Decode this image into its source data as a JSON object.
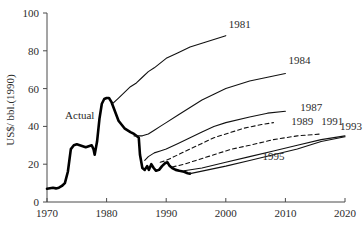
{
  "chart_data": {
    "type": "line",
    "title": "",
    "xlabel": "",
    "ylabel": "US$/ bbl.(1990)",
    "xlim": [
      1970,
      2020
    ],
    "ylim": [
      0,
      100
    ],
    "xticks": [
      "1970",
      "1980",
      "1990",
      "2000",
      "2010",
      "2020"
    ],
    "yticks": [
      "0",
      "20",
      "40",
      "60",
      "80",
      "100"
    ],
    "grid": false,
    "legend_position": "inline-end-of-line",
    "annotations": [
      {
        "text": "Actual",
        "x": 1975.5,
        "y": 44
      }
    ],
    "series": [
      {
        "name": "Actual",
        "style": "thick-solid",
        "label": "Actual",
        "points": [
          [
            1970,
            7
          ],
          [
            1971,
            7.5
          ],
          [
            1971.5,
            7.2
          ],
          [
            1972,
            7.6
          ],
          [
            1972.5,
            8.5
          ],
          [
            1973,
            10
          ],
          [
            1973.5,
            16
          ],
          [
            1974,
            28
          ],
          [
            1974.5,
            30
          ],
          [
            1975,
            30.5
          ],
          [
            1975.5,
            30
          ],
          [
            1976,
            29.5
          ],
          [
            1976.5,
            29
          ],
          [
            1977,
            29.5
          ],
          [
            1977.5,
            30
          ],
          [
            1977.8,
            28
          ],
          [
            1978,
            25
          ],
          [
            1978.4,
            32
          ],
          [
            1978.8,
            44
          ],
          [
            1979.2,
            52
          ],
          [
            1979.6,
            54.5
          ],
          [
            1980,
            55
          ],
          [
            1980.4,
            55
          ],
          [
            1980.8,
            53
          ],
          [
            1981.4,
            48
          ],
          [
            1982,
            43
          ],
          [
            1983,
            39
          ],
          [
            1984,
            37
          ],
          [
            1984.6,
            36
          ],
          [
            1985,
            35
          ],
          [
            1985.4,
            34
          ],
          [
            1985.6,
            25
          ],
          [
            1986,
            18
          ],
          [
            1986.4,
            17
          ],
          [
            1986.8,
            19
          ],
          [
            1987.1,
            17
          ],
          [
            1987.5,
            20
          ],
          [
            1987.9,
            18
          ],
          [
            1988.3,
            16.5
          ],
          [
            1988.8,
            17
          ],
          [
            1989.3,
            19
          ],
          [
            1989.8,
            20.5
          ],
          [
            1990.2,
            21
          ],
          [
            1990.6,
            19
          ],
          [
            1991,
            18
          ],
          [
            1991.6,
            17
          ],
          [
            1992.2,
            16.5
          ],
          [
            1993,
            16
          ],
          [
            1993.6,
            15.2
          ],
          [
            1994,
            15
          ]
        ]
      },
      {
        "name": "1981",
        "label": "1981",
        "style": "solid",
        "label_x": 2000.5,
        "label_y": 92,
        "points": [
          [
            1981,
            52
          ],
          [
            1982,
            55
          ],
          [
            1983,
            58
          ],
          [
            1984,
            61
          ],
          [
            1985,
            63
          ],
          [
            1986,
            66
          ],
          [
            1987,
            69
          ],
          [
            1988,
            71
          ],
          [
            1990,
            76
          ],
          [
            1992,
            79
          ],
          [
            1994,
            82
          ],
          [
            1996,
            84
          ],
          [
            1998,
            86
          ],
          [
            2000,
            88
          ]
        ]
      },
      {
        "name": "1984",
        "label": "1984",
        "style": "solid",
        "label_x": 2010.5,
        "label_y": 73,
        "points": [
          [
            1984.6,
            35
          ],
          [
            1986,
            35
          ],
          [
            1987,
            36
          ],
          [
            1988,
            38
          ],
          [
            1989,
            40
          ],
          [
            1990,
            42
          ],
          [
            1992,
            46
          ],
          [
            1994,
            50
          ],
          [
            1996,
            54
          ],
          [
            1998,
            57
          ],
          [
            2000,
            60
          ],
          [
            2004,
            64
          ],
          [
            2007,
            66
          ],
          [
            2010,
            68
          ]
        ]
      },
      {
        "name": "1987",
        "label": "1987",
        "style": "solid",
        "label_x": 2012.5,
        "label_y": 48,
        "points": [
          [
            1986.4,
            22
          ],
          [
            1987,
            24
          ],
          [
            1988,
            26
          ],
          [
            1989,
            27
          ],
          [
            1990,
            28
          ],
          [
            1992,
            31
          ],
          [
            1994,
            34
          ],
          [
            1996,
            37
          ],
          [
            1998,
            40
          ],
          [
            2000,
            42
          ],
          [
            2004,
            45
          ],
          [
            2007,
            47
          ],
          [
            2010,
            48
          ]
        ]
      },
      {
        "name": "1989",
        "label": "1989",
        "style": "dashed",
        "label_x": 2011.0,
        "label_y": 41,
        "points": [
          [
            1989,
            21
          ],
          [
            1990,
            22
          ],
          [
            1992,
            25
          ],
          [
            1994,
            28
          ],
          [
            1996,
            31
          ],
          [
            1998,
            34
          ],
          [
            2000,
            36
          ],
          [
            2003,
            39
          ],
          [
            2006,
            41
          ],
          [
            2008,
            42
          ]
        ]
      },
      {
        "name": "1991",
        "label": "1991",
        "style": "dashed",
        "label_x": 2016.0,
        "label_y": 41,
        "points": [
          [
            1991,
            18.5
          ],
          [
            1993,
            20
          ],
          [
            1995,
            22
          ],
          [
            1998,
            25
          ],
          [
            2001,
            28
          ],
          [
            2004,
            30
          ],
          [
            2008,
            33
          ],
          [
            2012,
            35
          ],
          [
            2016,
            36
          ]
        ]
      },
      {
        "name": "1993",
        "label": "1993",
        "style": "solid",
        "label_x": 2019.0,
        "label_y": 38,
        "points": [
          [
            1993,
            16.5
          ],
          [
            1996,
            18
          ],
          [
            2000,
            21
          ],
          [
            2004,
            24
          ],
          [
            2008,
            27
          ],
          [
            2012,
            30
          ],
          [
            2016,
            33
          ],
          [
            2020,
            35
          ]
        ]
      },
      {
        "name": "1995",
        "label": "1995",
        "style": "solid",
        "label_x": 2008.0,
        "label_y": 22,
        "points": [
          [
            1994,
            15
          ],
          [
            1997,
            17
          ],
          [
            2000,
            19
          ],
          [
            2004,
            22
          ],
          [
            2008,
            25
          ],
          [
            2012,
            28
          ],
          [
            2016,
            32
          ],
          [
            2020,
            34.5
          ]
        ]
      }
    ]
  }
}
